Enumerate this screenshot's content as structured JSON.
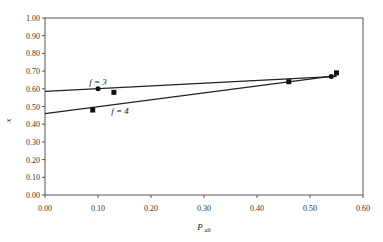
{
  "chart_data": {
    "type": "scatter",
    "title": "",
    "xlabel": "P",
    "xlabel_sub": "ab",
    "ylabel": "x",
    "xlim": [
      0.0,
      0.6
    ],
    "ylim": [
      0.0,
      1.0
    ],
    "x_ticks": [
      "0.00",
      "0.10",
      "0.20",
      "0.30",
      "0.40",
      "0.50",
      "0.60"
    ],
    "y_ticks": [
      "0.00",
      "0.10",
      "0.20",
      "0.30",
      "0.40",
      "0.50",
      "0.60",
      "0.70",
      "0.80",
      "0.90",
      "1.00"
    ],
    "grid": false,
    "series": [
      {
        "name": "f = 3",
        "marker": "circle",
        "points": [
          [
            0.1,
            0.6
          ],
          [
            0.54,
            0.67
          ]
        ],
        "fit_line": [
          [
            0.0,
            0.585
          ],
          [
            0.55,
            0.67
          ]
        ]
      },
      {
        "name": "f = 4",
        "marker": "square",
        "points": [
          [
            0.09,
            0.48
          ],
          [
            0.13,
            0.58
          ],
          [
            0.46,
            0.64
          ],
          [
            0.55,
            0.69
          ]
        ],
        "fit_line": [
          [
            0.0,
            0.46
          ],
          [
            0.55,
            0.675
          ]
        ]
      }
    ],
    "annotations": [
      {
        "text": "f = 3",
        "x": 0.1,
        "y": 0.62
      },
      {
        "text": "f = 4",
        "x": 0.125,
        "y": 0.46
      }
    ]
  }
}
